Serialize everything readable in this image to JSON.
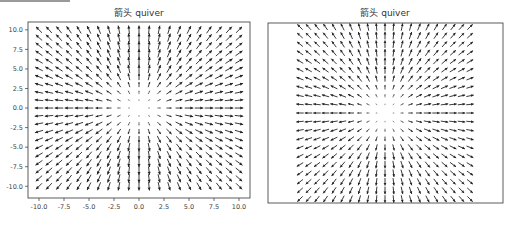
{
  "top_bar": {
    "color": "#9a9a9a"
  },
  "chart_data": [
    {
      "type": "quiver",
      "title": "箭头 quiver",
      "xlabel": "",
      "ylabel": "",
      "x_range": [
        -10,
        10
      ],
      "y_range": [
        -10,
        10
      ],
      "grid_step": 1,
      "u_formula": "X",
      "v_formula": "Y",
      "direction": "radial-outward",
      "xlim": [
        -11.1,
        11.1
      ],
      "ylim": [
        -11.5,
        11.0
      ],
      "xticks": [
        -10.0,
        -7.5,
        -5.0,
        -2.5,
        0.0,
        2.5,
        5.0,
        7.5,
        10.0
      ],
      "xtick_labels": [
        "-10.0",
        "-7.5",
        "-5.0",
        "-2.5",
        "0.0",
        "2.5",
        "5.0",
        "7.5",
        "10.0"
      ],
      "yticks": [
        10.0,
        7.5,
        5.0,
        2.5,
        0.0,
        -2.5,
        -5.0,
        -7.5,
        -10.0
      ],
      "ytick_labels": [
        "10.0",
        "7.5",
        "5.0",
        "2.5",
        "0.0",
        "-2.5",
        "-5.0",
        "-7.5",
        "-10.0"
      ],
      "show_ticks": true,
      "grid": false,
      "arrow_color": "#222222"
    },
    {
      "type": "quiver",
      "title": "箭头 quiver",
      "xlabel": "",
      "ylabel": "",
      "x_range": [
        -10,
        10
      ],
      "y_range": [
        -10,
        10
      ],
      "grid_step": 1,
      "u_formula": "X",
      "v_formula": "Y",
      "direction": "radial-outward",
      "aspect": "equal",
      "show_ticks": false,
      "grid": false,
      "arrow_color": "#222222"
    }
  ]
}
